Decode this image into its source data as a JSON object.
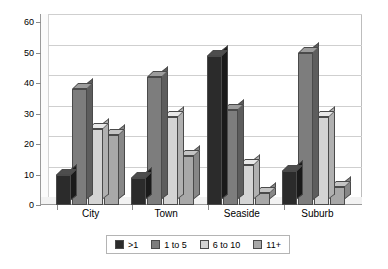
{
  "chart_data": {
    "type": "bar",
    "title": "",
    "xlabel": "",
    "ylabel": "",
    "ylim": [
      0,
      60
    ],
    "ytick_step": 10,
    "yticks": [
      0,
      10,
      20,
      30,
      40,
      50,
      60
    ],
    "grid": true,
    "legend_position": "bottom",
    "style": "3d-clustered-column",
    "categories": [
      "City",
      "Town",
      "Seaside",
      "Suburb"
    ],
    "series": [
      {
        "name": ">1",
        "color": "#2b2b2b",
        "values": [
          10,
          9,
          49,
          11
        ]
      },
      {
        "name": "1 to 5",
        "color": "#7d7d7d",
        "values": [
          38,
          42,
          31,
          50
        ]
      },
      {
        "name": "6 to 10",
        "color": "#d4d4d4",
        "values": [
          25,
          29,
          13,
          29
        ]
      },
      {
        "name": "11+",
        "color": "#a8a8a8",
        "values": [
          23,
          16,
          4,
          6
        ]
      }
    ]
  }
}
